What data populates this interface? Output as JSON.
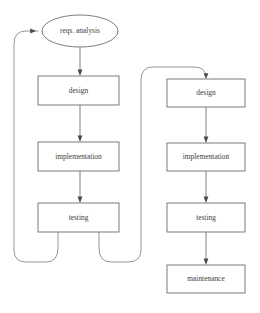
{
  "diagram": {
    "background_color": "#ffffff",
    "stroke_color": "#737373",
    "text_color": "#3d3d3d",
    "arrow_color": "#4a4a4a",
    "left_flow": {
      "name": "iterative-waterfall",
      "nodes": [
        {
          "id": "reqs",
          "label": "reqs. analysis",
          "shape": "ellipse",
          "cx": 80,
          "cy": 31,
          "rx": 38,
          "ry": 16
        },
        {
          "id": "design",
          "label": "design",
          "shape": "rect",
          "x": 38,
          "y": 76,
          "w": 81,
          "h": 29
        },
        {
          "id": "implementation",
          "label": "implementation",
          "shape": "rect",
          "x": 38,
          "y": 142,
          "w": 81,
          "h": 29
        },
        {
          "id": "testing",
          "label": "testing",
          "shape": "rect",
          "x": 38,
          "y": 203,
          "w": 81,
          "h": 29
        }
      ],
      "edges": [
        {
          "from": "reqs",
          "to": "design",
          "type": "straight-down"
        },
        {
          "from": "design",
          "to": "implementation",
          "type": "straight-down"
        },
        {
          "from": "implementation",
          "to": "testing",
          "type": "straight-down"
        }
      ],
      "feedback_loops": [
        {
          "id": "testing-to-reqs",
          "from": "testing",
          "to": "reqs",
          "side": "left"
        },
        {
          "id": "testing-to-design",
          "from": "testing",
          "to": "design-right",
          "side": "right"
        }
      ]
    },
    "right_flow": {
      "name": "linear-waterfall-with-maintenance",
      "nodes": [
        {
          "id": "design",
          "label": "design",
          "shape": "rect",
          "x": 167,
          "y": 79,
          "w": 78,
          "h": 28
        },
        {
          "id": "implementation",
          "label": "implementation",
          "shape": "rect",
          "x": 167,
          "y": 143,
          "w": 78,
          "h": 28
        },
        {
          "id": "testing",
          "label": "testing",
          "shape": "rect",
          "x": 167,
          "y": 203,
          "w": 78,
          "h": 29
        },
        {
          "id": "maintenance",
          "label": "maintenance",
          "shape": "rect",
          "x": 167,
          "y": 265,
          "w": 78,
          "h": 28
        }
      ],
      "edges": [
        {
          "from": "design",
          "to": "implementation",
          "type": "straight-down"
        },
        {
          "from": "implementation",
          "to": "testing",
          "type": "straight-down"
        },
        {
          "from": "testing",
          "to": "maintenance",
          "type": "straight-down"
        }
      ],
      "incoming_loop": {
        "id": "left-testing-to-right-design",
        "target": "design"
      }
    }
  }
}
